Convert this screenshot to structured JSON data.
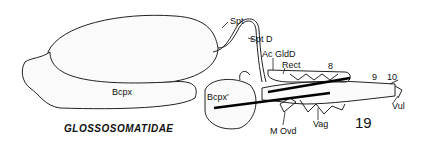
{
  "figure": {
    "title": "GLOSSOSOMATIDAE",
    "figure_number": "19",
    "labels": {
      "spt": "Spt",
      "spt_d": "Spt D",
      "ac_gld_d": "Ac GldD",
      "rect": "Rect",
      "seg8": "8",
      "seg9": "9",
      "seg10": "10",
      "vul": "Vul",
      "vag": "Vag",
      "m_ovd": "M Ovd",
      "bcpx": "Bcpx",
      "bcpx_prime": "Bcpx'"
    }
  }
}
